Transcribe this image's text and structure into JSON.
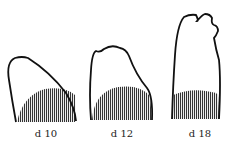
{
  "figure": {
    "stages": [
      {
        "label": "d 10"
      },
      {
        "label": "d 12"
      },
      {
        "label": "d 18"
      }
    ],
    "colors": {
      "outline": "#111111",
      "hatch": "#333333",
      "background": "#ffffff"
    }
  }
}
